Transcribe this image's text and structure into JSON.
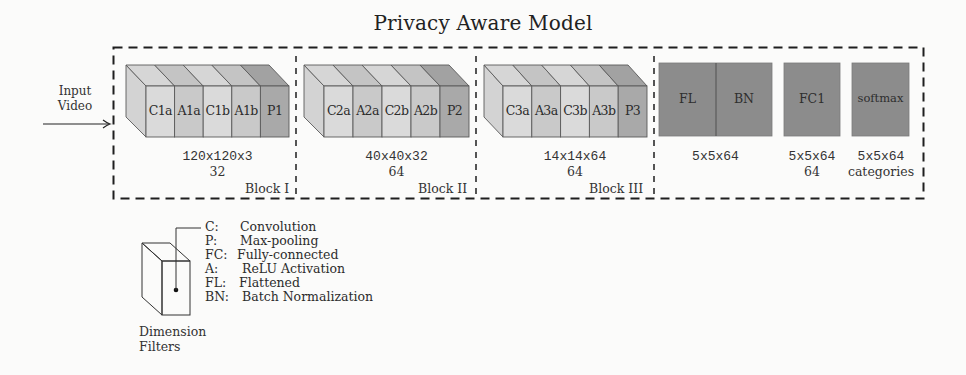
{
  "title": "Privacy Aware Model",
  "input": {
    "line1": "Input",
    "line2": "Video",
    "arrow_icon": "right-arrow"
  },
  "blocks": [
    {
      "name": "Block I",
      "slices": [
        {
          "label": "C1a",
          "type": "conv"
        },
        {
          "label": "A1a",
          "type": "activation"
        },
        {
          "label": "C1b",
          "type": "conv"
        },
        {
          "label": "A1b",
          "type": "activation"
        },
        {
          "label": "P1",
          "type": "pool"
        }
      ],
      "dimension": "120x120x3",
      "filters": "32"
    },
    {
      "name": "Block II",
      "slices": [
        {
          "label": "C2a",
          "type": "conv"
        },
        {
          "label": "A2a",
          "type": "activation"
        },
        {
          "label": "C2b",
          "type": "conv"
        },
        {
          "label": "A2b",
          "type": "activation"
        },
        {
          "label": "P2",
          "type": "pool"
        }
      ],
      "dimension": "40x40x32",
      "filters": "64"
    },
    {
      "name": "Block III",
      "slices": [
        {
          "label": "C3a",
          "type": "conv"
        },
        {
          "label": "A3a",
          "type": "activation"
        },
        {
          "label": "C3b",
          "type": "conv"
        },
        {
          "label": "A3b",
          "type": "activation"
        },
        {
          "label": "P3",
          "type": "pool"
        }
      ],
      "dimension": "14x14x64",
      "filters": "64"
    }
  ],
  "dense": {
    "fl_bn": {
      "left_label": "FL",
      "right_label": "BN",
      "dimension": "5x5x64"
    },
    "fc1": {
      "label": "FC1",
      "dimension": "5x5x64",
      "filters": "64"
    },
    "softmax": {
      "label": "softmax",
      "dimension": "5x5x64",
      "filters": "categories"
    }
  },
  "legend": {
    "items": [
      {
        "key": "C:",
        "desc": "Convolution"
      },
      {
        "key": "P:",
        "desc": "Max-pooling"
      },
      {
        "key": "FC:",
        "desc": "Fully-connected"
      },
      {
        "key": "A:",
        "desc": "ReLU Activation"
      },
      {
        "key": "FL:",
        "desc": "Flattened"
      },
      {
        "key": "BN:",
        "desc": "Batch Normalization"
      }
    ],
    "caption_line1": "Dimension",
    "caption_line2": "Filters"
  },
  "colors": {
    "conv": "#dadada",
    "conv_top": "#d6d6d6",
    "activation": "#c9c9c9",
    "activation_top": "#c4c4c4",
    "pool": "#a9a9a9",
    "pool_top": "#a2a2a2",
    "side": "#d3d3d3",
    "dense": "#8c8c8c",
    "edge": "#5a5a5a",
    "dash": "#1e1e1e"
  }
}
